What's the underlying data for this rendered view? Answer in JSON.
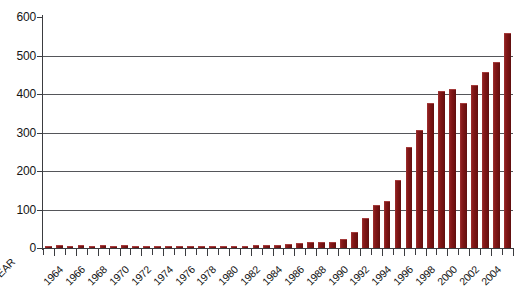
{
  "chart_data": {
    "type": "bar",
    "title": "",
    "xlabel": "YEAR",
    "ylabel": "",
    "ylim": [
      0,
      600
    ],
    "yticks": [
      0,
      100,
      200,
      300,
      400,
      500,
      600
    ],
    "grid": true,
    "legend": "none",
    "bar_color": "#7d1515",
    "axis_color": "#3b3c40",
    "gridline_color": "#55565a",
    "categories": [
      "1963",
      "1964",
      "1965",
      "1966",
      "1967",
      "1968",
      "1969",
      "1970",
      "1971",
      "1972",
      "1973",
      "1974",
      "1975",
      "1976",
      "1977",
      "1978",
      "1979",
      "1980",
      "1981",
      "1982",
      "1983",
      "1984",
      "1985",
      "1986",
      "1987",
      "1988",
      "1989",
      "1990",
      "1991",
      "1992",
      "1993",
      "1994",
      "1995",
      "1996",
      "1997",
      "1998",
      "1999",
      "2000",
      "2001",
      "2002",
      "2003",
      "2004",
      "2005"
    ],
    "tick_labels": [
      "1964",
      "1966",
      "1968",
      "1970",
      "1972",
      "1974",
      "1976",
      "1978",
      "1980",
      "1982",
      "1984",
      "1986",
      "1988",
      "1990",
      "1992",
      "1994",
      "1996",
      "1998",
      "2000",
      "2002",
      "2004"
    ],
    "values": [
      3,
      4,
      3,
      4,
      3,
      4,
      3,
      4,
      3,
      3,
      2,
      2,
      2,
      2,
      2,
      3,
      3,
      3,
      3,
      4,
      4,
      5,
      8,
      10,
      12,
      12,
      14,
      22,
      40,
      75,
      110,
      120,
      175,
      260,
      305,
      375,
      405,
      410,
      375,
      420,
      455,
      480,
      555
    ]
  }
}
